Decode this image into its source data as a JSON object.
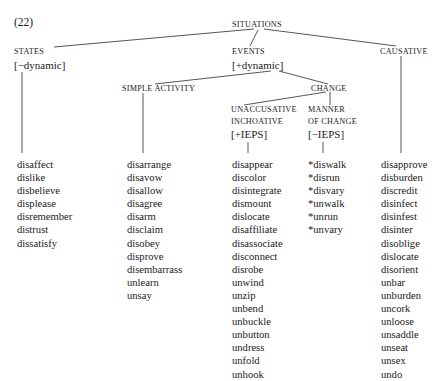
{
  "example_number": "(22)",
  "tree": {
    "root": {
      "label": "SITUATIONS"
    },
    "states": {
      "label": "STATES",
      "feature": "[−dynamic]"
    },
    "events": {
      "label": "EVENTS",
      "feature": "[+dynamic]"
    },
    "causative": {
      "label": "CAUSATIVE"
    },
    "simple_activity": {
      "label": "SIMPLE ACTIVITY"
    },
    "change": {
      "label": "CHANGE"
    },
    "unaccusative": {
      "label_line1": "UNACCUSATIVE",
      "label_line2": "INCHOATIVE",
      "feature": "[+IEPS]"
    },
    "manner": {
      "label_line1": "MANNER",
      "label_line2": "OF CHANGE",
      "feature": "[−IEPS]"
    }
  },
  "columns": [
    {
      "parent": "STATES",
      "words": [
        "disaffect",
        "dislike",
        "disbelieve",
        "displease",
        "disremember",
        "distrust",
        "dissatisfy"
      ]
    },
    {
      "parent": "SIMPLE ACTIVITY",
      "words": [
        "disarrange",
        "disavow",
        "disallow",
        "disagree",
        "disarm",
        "disclaim",
        "disobey",
        "disprove",
        "disembarrass",
        "unlearn",
        "unsay"
      ]
    },
    {
      "parent": "UNACCUSATIVE INCHOATIVE",
      "words": [
        "disappear",
        "discolor",
        "disintegrate",
        "dismount",
        "dislocate",
        "disaffiliate",
        "disassociate",
        "disconnect",
        "disrobe",
        "unwind",
        "unzip",
        "unbend",
        "unbuckle",
        "unbutton",
        "undress",
        "unfold",
        "unhook"
      ]
    },
    {
      "parent": "MANNER OF CHANGE",
      "words": [
        "*diswalk",
        "*disrun",
        "*disvary",
        "*unwalk",
        "*unrun",
        "*unvary"
      ]
    },
    {
      "parent": "CAUSATIVE",
      "words": [
        "disapprove",
        "disburden",
        "discredit",
        "disinfect",
        "disinfest",
        "disinter",
        "disoblige",
        "dislocate",
        "disorient",
        "unbar",
        "unburden",
        "uncork",
        "unloose",
        "unsaddle",
        "unseat",
        "unsex",
        "undo"
      ]
    }
  ],
  "colors": {
    "text": "#1a1a1a",
    "line": "#2b2b2b",
    "background": "#ffffff"
  }
}
